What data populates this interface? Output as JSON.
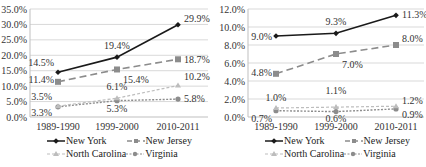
{
  "chart_data": [
    {
      "type": "line",
      "title": "",
      "xlabel": "",
      "ylabel": "",
      "categories": [
        "1989-1990",
        "1999-2000",
        "2010-2011"
      ],
      "ylim": [
        0,
        35
      ],
      "yticks": [
        "0.0%",
        "5.0%",
        "10.0%",
        "15.0%",
        "20.0%",
        "25.0%",
        "30.0%",
        "35.0%"
      ],
      "grid": true,
      "legend_position": "bottom",
      "series": [
        {
          "name": "New York",
          "values": [
            14.5,
            19.4,
            29.9
          ],
          "labels": [
            "14.5%",
            "19.4%",
            "29.9%"
          ],
          "color": "#1a1a1a",
          "style": "solid",
          "marker": "diamond"
        },
        {
          "name": "New Jersey",
          "values": [
            11.4,
            15.4,
            18.7
          ],
          "labels": [
            "11.4%",
            "15.4%",
            "18.7%"
          ],
          "color": "#8c8c8c",
          "style": "long-dash",
          "marker": "square"
        },
        {
          "name": "North Carolina",
          "values": [
            3.5,
            6.1,
            10.2
          ],
          "labels": [
            "3.5%",
            "6.1%",
            "10.2%"
          ],
          "color": "#bdbdbd",
          "style": "dash",
          "marker": "triangle"
        },
        {
          "name": "Virginia",
          "values": [
            3.3,
            5.3,
            5.8
          ],
          "labels": [
            "3.3%",
            "5.3%",
            "5.8%"
          ],
          "color": "#8c8c8c",
          "style": "dot-dash",
          "marker": "circle"
        }
      ]
    },
    {
      "type": "line",
      "title": "",
      "xlabel": "",
      "ylabel": "",
      "categories": [
        "1989-1990",
        "1999-2000",
        "2010-2011"
      ],
      "ylim": [
        0,
        12
      ],
      "yticks": [
        "0.0%",
        "2.0%",
        "4.0%",
        "6.0%",
        "8.0%",
        "10.0%",
        "12.0%"
      ],
      "grid": true,
      "legend_position": "bottom",
      "series": [
        {
          "name": "New York",
          "values": [
            9.0,
            9.3,
            11.3
          ],
          "labels": [
            "9.0%",
            "9.3%",
            "11.3%"
          ],
          "color": "#1a1a1a",
          "style": "solid",
          "marker": "diamond"
        },
        {
          "name": "New Jersey",
          "values": [
            4.8,
            7.0,
            8.0
          ],
          "labels": [
            "4.8%",
            "7.0%",
            "8.0%"
          ],
          "color": "#8c8c8c",
          "style": "long-dash",
          "marker": "square"
        },
        {
          "name": "North Carolina",
          "values": [
            1.0,
            1.1,
            1.2
          ],
          "labels": [
            "1.0%",
            "1.1%",
            "1.2%"
          ],
          "color": "#bdbdbd",
          "style": "dash",
          "marker": "triangle"
        },
        {
          "name": "Virginia",
          "values": [
            0.7,
            0.6,
            0.9
          ],
          "labels": [
            "0.7%",
            "0.6%",
            "0.9%"
          ],
          "color": "#8c8c8c",
          "style": "dot-dash",
          "marker": "circle"
        }
      ]
    }
  ],
  "legend": {
    "items": [
      "New York",
      "New Jersey",
      "North Carolina",
      "Virginia"
    ]
  }
}
